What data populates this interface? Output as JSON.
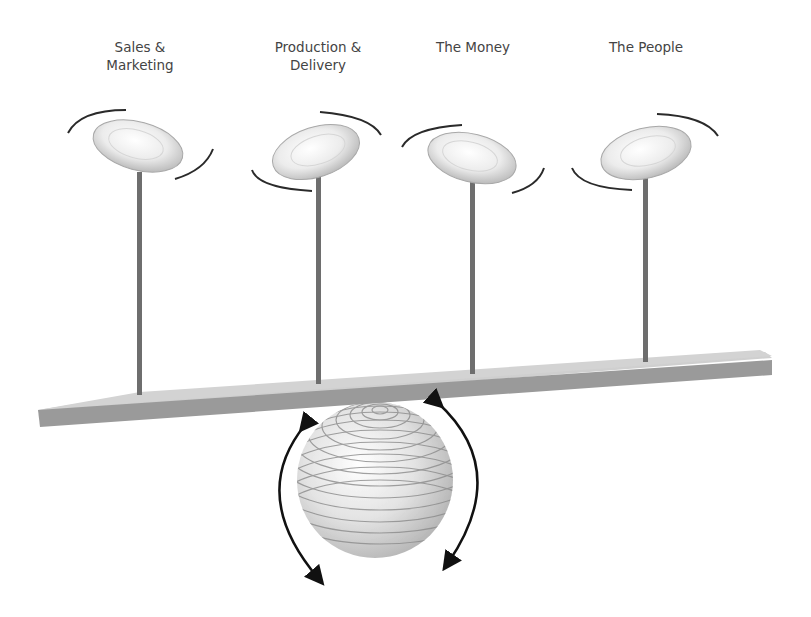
{
  "diagram": {
    "plates": [
      {
        "label": "Sales &\nMarketing",
        "x": 140,
        "label_y": 38
      },
      {
        "label": "Production &\nDelivery",
        "x": 318,
        "label_y": 38
      },
      {
        "label": "The Money",
        "x": 473,
        "label_y": 38
      },
      {
        "label": "The People",
        "x": 646,
        "label_y": 38
      }
    ],
    "colors": {
      "board_top": "#cfcfcf",
      "board_side": "#9a9a9a",
      "pole": "#6e6e6e",
      "swoosh": "#2a2a2a",
      "arrow": "#111111",
      "ball_stripe": "#8a8a8a",
      "text": "#444444"
    }
  }
}
